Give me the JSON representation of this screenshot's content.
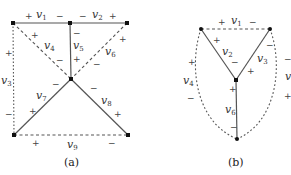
{
  "figure_a": {
    "caption": "(a)",
    "vertices": [
      {
        "id": "a1",
        "x": 13,
        "y": 23
      },
      {
        "id": "a2",
        "x": 70,
        "y": 23
      },
      {
        "id": "a3",
        "x": 127,
        "y": 23
      },
      {
        "id": "a4",
        "x": 71,
        "y": 79
      },
      {
        "id": "a5",
        "x": 14,
        "y": 135
      },
      {
        "id": "a6",
        "x": 128,
        "y": 135
      }
    ],
    "edges": [
      {
        "name": "v1",
        "sub": "1",
        "style": "solid",
        "plus": "+",
        "minus": "−"
      },
      {
        "name": "v2",
        "sub": "2",
        "style": "solid",
        "plus": "+",
        "minus": "−"
      },
      {
        "name": "v3",
        "sub": "3",
        "style": "dotted",
        "plus": "+",
        "minus": "−"
      },
      {
        "name": "v4",
        "sub": "4",
        "style": "dashed",
        "plus": "+",
        "minus": "−"
      },
      {
        "name": "v5",
        "sub": "5",
        "style": "solid",
        "plus": "+",
        "minus": "−"
      },
      {
        "name": "v6",
        "sub": "6",
        "style": "dashed",
        "plus": "+",
        "minus": "−"
      },
      {
        "name": "v7",
        "sub": "7",
        "style": "solid",
        "plus": "+",
        "minus": "−"
      },
      {
        "name": "v8",
        "sub": "8",
        "style": "solid",
        "plus": "+",
        "minus": "−"
      },
      {
        "name": "v9",
        "sub": "9",
        "style": "dashed",
        "plus": "+",
        "minus": "−"
      }
    ]
  },
  "figure_b": {
    "caption": "(b)",
    "vertices": [
      {
        "id": "b1",
        "x": 201,
        "y": 29
      },
      {
        "id": "b2",
        "x": 270,
        "y": 29
      },
      {
        "id": "b3",
        "x": 236,
        "y": 80
      },
      {
        "id": "b4",
        "x": 237,
        "y": 139
      }
    ],
    "edges": [
      {
        "name": "v1",
        "sub": "1",
        "style": "dashed",
        "plus": "+",
        "minus": "−"
      },
      {
        "name": "v2",
        "sub": "2",
        "style": "solid",
        "plus": "+",
        "minus": "−"
      },
      {
        "name": "v3",
        "sub": "3",
        "style": "solid",
        "plus": "+",
        "minus": "−"
      },
      {
        "name": "v4",
        "sub": "4",
        "style": "dashed",
        "plus": "+",
        "minus": "−"
      },
      {
        "name": "v5",
        "sub": "5",
        "style": "dashed",
        "plus": "+",
        "minus": "−"
      },
      {
        "name": "v6",
        "sub": "6",
        "style": "solid",
        "plus": "+",
        "minus": "−"
      }
    ]
  },
  "symbols": {
    "v": "v",
    "plus": "+",
    "minus": "−"
  }
}
